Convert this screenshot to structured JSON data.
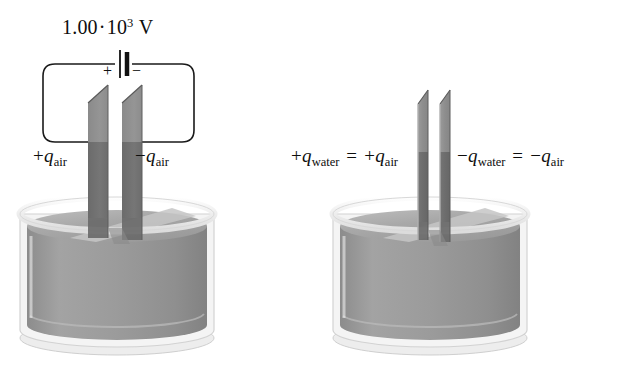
{
  "figure": {
    "background_color": "#ffffff"
  },
  "panels": [
    {
      "id": "air",
      "name": "capacitor-in-air",
      "voltage": {
        "mantissa": "1.00",
        "operator": "·",
        "base": "10",
        "exponent": "3",
        "unit": "V",
        "full_text": "1.00 · 10³ V"
      },
      "battery": {
        "positive_terminal": "+",
        "negative_terminal": "−",
        "name": "battery-symbol"
      },
      "left_plate_label": {
        "sign": "+",
        "symbol": "q",
        "subscript": "air",
        "full_text": "+q_air"
      },
      "right_plate_label": {
        "sign": "−",
        "symbol": "q",
        "subscript": "air",
        "full_text": "−q_air"
      }
    },
    {
      "id": "water",
      "name": "capacitor-in-water",
      "left_plate_label": {
        "sign": "+",
        "symbol": "q",
        "subscript": "water",
        "equals": "=",
        "sign2": "+",
        "symbol2": "q",
        "subscript2": "air",
        "full_text": "+q_water = +q_air"
      },
      "right_plate_label": {
        "sign": "−",
        "symbol": "q",
        "subscript": "water",
        "equals": "=",
        "sign2": "−",
        "symbol2": "q",
        "subscript2": "air",
        "full_text": "−q_water = −q_air"
      }
    }
  ],
  "colors": {
    "plate_upper": "#8e8e8e",
    "plate_lower": "#6f6f6f",
    "plate_edge": "#5c5c5c",
    "liquid_body": "#979797",
    "liquid_surface": "#b4b4b4",
    "liquid_highlight": "#c9c9c9",
    "beaker_rim": "#f2f2f2",
    "beaker_base": "#efefef",
    "wire": "#1a1a1a",
    "text": "#0d0d0d"
  },
  "objects": {
    "beaker_left_name": "beaker-air",
    "beaker_right_name": "beaker-water",
    "plate_left_air": "capacitor-plate-positive-air",
    "plate_right_air": "capacitor-plate-negative-air",
    "plate_left_water": "capacitor-plate-positive-water",
    "plate_right_water": "capacitor-plate-negative-water"
  }
}
